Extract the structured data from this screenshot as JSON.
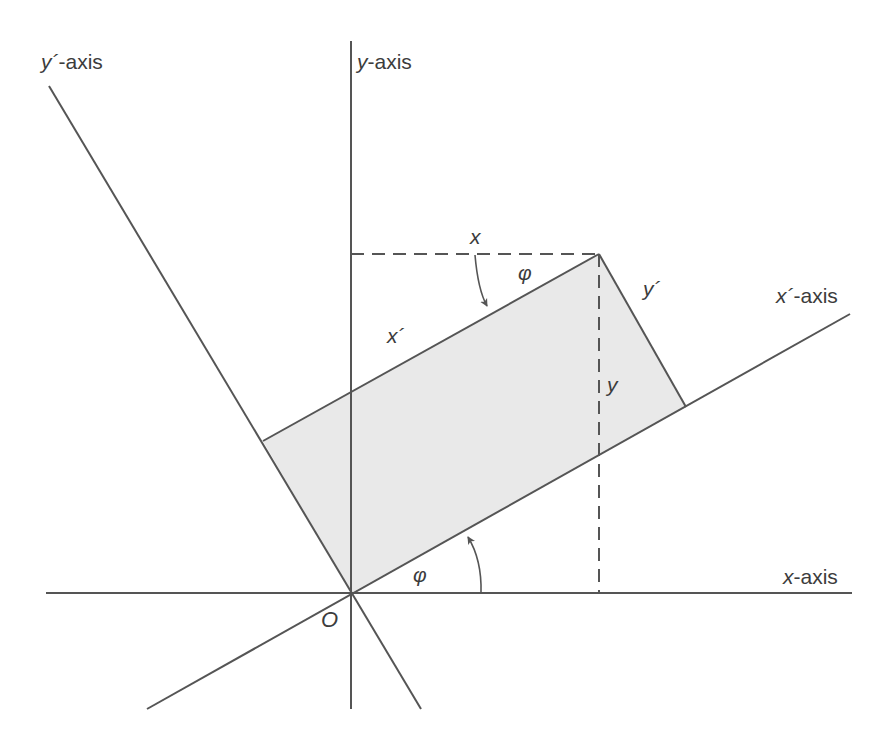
{
  "diagram": {
    "type": "coordinate-rotation",
    "labels": {
      "y_prime_axis": {
        "var": "y´",
        "suffix": "-axis"
      },
      "y_axis": {
        "var": "y",
        "suffix": "-axis"
      },
      "x_prime_axis": {
        "var": "x´",
        "suffix": "-axis"
      },
      "x_axis": {
        "var": "x",
        "suffix": "-axis"
      },
      "origin": "O",
      "x_coord": "x",
      "y_coord": "y",
      "x_prime_coord": "x´",
      "y_prime_coord": "y´",
      "angle_top": "φ",
      "angle_bottom": "φ"
    },
    "colors": {
      "line": "#555555",
      "fill": "#e9e9e9",
      "text": "#3c3c3c"
    }
  }
}
